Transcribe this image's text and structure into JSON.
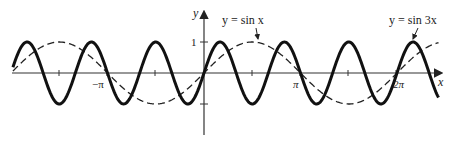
{
  "chart_data": {
    "type": "line",
    "title": "",
    "xlabel": "x",
    "ylabel": "y",
    "x_range": [
      -1.98,
      2.43
    ],
    "x_unit": "pi",
    "ylim": [
      -1,
      1
    ],
    "grid": false,
    "x_ticks": [
      {
        "value": -1.5,
        "label": ""
      },
      {
        "value": -1,
        "label": "−π"
      },
      {
        "value": -0.5,
        "label": ""
      },
      {
        "value": 0.5,
        "label": ""
      },
      {
        "value": 1,
        "label": "π"
      },
      {
        "value": 1.5,
        "label": ""
      },
      {
        "value": 2,
        "label": "2π"
      }
    ],
    "y_ticks": [
      {
        "value": 1,
        "label": "1"
      },
      {
        "value": -1,
        "label": ""
      }
    ],
    "series": [
      {
        "name": "y = sin x",
        "function": "sin(x)",
        "style": "dashed",
        "frequency": 1,
        "color": "#222222"
      },
      {
        "name": "y = sin 3x",
        "function": "sin(3x)",
        "style": "solid-bold",
        "frequency": 3,
        "color": "#111111"
      }
    ],
    "annotations": [
      {
        "text": "y = sin x",
        "points_to_series": "y = sin x",
        "near_x_pi": 0.5
      },
      {
        "text": "y = sin 3x",
        "points_to_series": "y = sin 3x",
        "near_x_pi": 2.17
      }
    ]
  },
  "labels": {
    "x_axis": "x",
    "y_axis": "y",
    "y_one": "1",
    "neg_pi": "−π",
    "pi": "π",
    "two_pi": "2π",
    "sin_x": "y = sin x",
    "sin_3x": "y = sin 3x"
  }
}
